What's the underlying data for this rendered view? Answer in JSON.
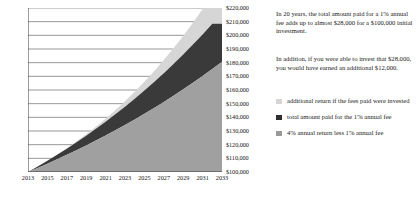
{
  "chart_data": {
    "type": "area",
    "stacked": true,
    "title": "",
    "xlabel": "",
    "ylabel": "",
    "grid": true,
    "legend_position": "right",
    "x": [
      2013,
      2014,
      2015,
      2016,
      2017,
      2018,
      2019,
      2020,
      2021,
      2022,
      2023,
      2024,
      2025,
      2026,
      2027,
      2028,
      2029,
      2030,
      2031,
      2032,
      2033
    ],
    "xticklabels": [
      "2013",
      "2015",
      "2017",
      "2019",
      "2021",
      "2023",
      "2025",
      "2027",
      "2029",
      "2031",
      "2033"
    ],
    "yticklabels": [
      "$100,000",
      "$110,000",
      "$120,000",
      "$130,000",
      "$140,000",
      "$150,000",
      "$160,000",
      "$170,000",
      "$180,000",
      "$190,000",
      "$200,000",
      "$210,000",
      "$220,000"
    ],
    "ylim": [
      100000,
      220000
    ],
    "ytick_step": 10000,
    "series": [
      {
        "name": "4% annual return less 1% annual fee",
        "color": "#a0a0a0",
        "values": [
          100000,
          103000,
          106090,
          109273,
          112551,
          115927,
          119405,
          122987,
          126677,
          130477,
          134392,
          138424,
          142576,
          146853,
          151259,
          155797,
          160471,
          165285,
          170244,
          175351,
          180611
        ]
      },
      {
        "name": "total amount paid for the 1% annual fee",
        "color": "#3a3a3a",
        "values": [
          0,
          1030,
          2121,
          3276,
          4497,
          5787,
          7149,
          8587,
          10103,
          11701,
          13385,
          15159,
          17026,
          18991,
          21058,
          23232,
          25518,
          27921,
          30446,
          33098,
          27888
        ]
      },
      {
        "name": "additional return if the fees paid were invested",
        "color": "#d6d6d6",
        "values": [
          0,
          0,
          60,
          190,
          400,
          700,
          1100,
          1620,
          2270,
          3060,
          4000,
          5110,
          6400,
          7880,
          9560,
          11460,
          13590,
          15970,
          18610,
          21530,
          12000
        ]
      }
    ]
  },
  "annotations": {
    "paragraph_1": "In 20 years, the total amount paid for a 1% annual fee adds up to almost $28,000 for a $100,000 initial investment.",
    "paragraph_2": "In addition, if you were able to invest that $28,000, you would have earned an additional $12,000."
  },
  "legend": {
    "items": [
      {
        "label": "additional return if the fees paid were invested",
        "color": "#d6d6d6",
        "swatch": "legend-swatch-light"
      },
      {
        "label": "total amount paid for the 1% annual fee",
        "color": "#2e2e2e",
        "swatch": "legend-swatch-dark"
      },
      {
        "label": "4% annual return less 1% annual fee",
        "color": "#9a9a9a",
        "swatch": "legend-swatch-medium"
      }
    ]
  },
  "colors": {
    "band_bottom": "#a0a0a0",
    "band_middle": "#3a3a3a",
    "band_top": "#d6d6d6",
    "gridline": "#8c8c8c",
    "axis": "#3d3d3d",
    "text": "#1a1a1a",
    "background": "#ffffff"
  }
}
